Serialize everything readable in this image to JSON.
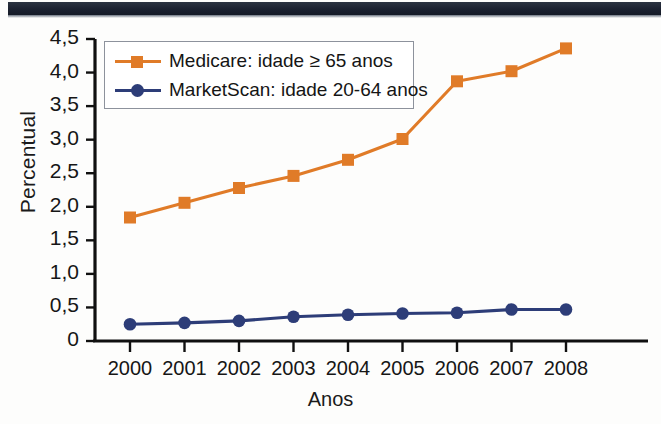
{
  "chart_data": {
    "type": "line",
    "title": "",
    "xlabel": "Anos",
    "ylabel": "Percentual",
    "categories": [
      "2000",
      "2001",
      "2002",
      "2003",
      "2004",
      "2005",
      "2006",
      "2007",
      "2008"
    ],
    "x": [
      2000,
      2001,
      2002,
      2003,
      2004,
      2005,
      2006,
      2007,
      2008
    ],
    "ylim": [
      0,
      4.5
    ],
    "ytick_labels": [
      "0",
      "0,5",
      "1,0",
      "1,5",
      "2,0",
      "2,5",
      "3,0",
      "3,5",
      "4,0",
      "4,5"
    ],
    "ytick_values": [
      0,
      0.5,
      1.0,
      1.5,
      2.0,
      2.5,
      3.0,
      3.5,
      4.0,
      4.5
    ],
    "grid": false,
    "legend_position": "upper-left-inside",
    "series": [
      {
        "name": "Medicare: idade ≥ 65 anos",
        "color": "#e07b28",
        "marker": "square",
        "values": [
          1.84,
          2.06,
          2.28,
          2.46,
          2.7,
          3.01,
          3.87,
          4.02,
          4.36
        ]
      },
      {
        "name": "MarketScan: idade 20-64 anos",
        "color": "#2d3d78",
        "marker": "circle",
        "values": [
          0.25,
          0.27,
          0.3,
          0.36,
          0.39,
          0.41,
          0.42,
          0.47,
          0.47
        ]
      }
    ]
  },
  "legend": {
    "entries": [
      {
        "label": "Medicare: idade ≥ 65 anos",
        "icon": "legend-line-square-marker"
      },
      {
        "label": "MarketScan: idade 20-64 anos",
        "icon": "legend-line-circle-marker"
      }
    ]
  },
  "axes": {
    "y_axis_title": "Percentual",
    "x_axis_title": "Anos"
  },
  "colors": {
    "medicare": "#e07b28",
    "marketscan": "#2d3d78",
    "axis": "#101010",
    "legend_border": "#8d929c",
    "top_bar": "#1b2130"
  }
}
